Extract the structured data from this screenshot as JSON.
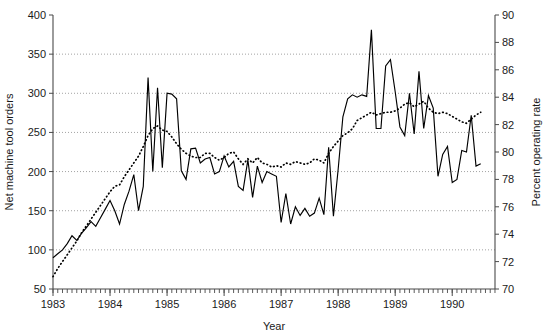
{
  "chart_data": {
    "type": "line",
    "title": "",
    "xlabel": "Year",
    "ylabel": "Net machine tool orders",
    "ylabel_right": "Percent operating rate",
    "grid": true,
    "legend": "none",
    "xlim": [
      1983.0,
      1990.75
    ],
    "ylim": [
      50,
      400
    ],
    "ylim_right": [
      70,
      90
    ],
    "ytick_labels": [
      "50",
      "100",
      "150",
      "200",
      "250",
      "300",
      "350",
      "400"
    ],
    "ytick_values": [
      50,
      100,
      150,
      200,
      250,
      300,
      350,
      400
    ],
    "ytick_right_labels": [
      "70",
      "72",
      "74",
      "76",
      "78",
      "80",
      "82",
      "84",
      "86",
      "88",
      "90"
    ],
    "ytick_right_values": [
      70,
      72,
      74,
      76,
      78,
      80,
      82,
      84,
      86,
      88,
      90
    ],
    "xtick_labels": [
      "1983",
      "1984",
      "1985",
      "1986",
      "1987",
      "1988",
      "1989",
      "1990"
    ],
    "xtick_values": [
      1983,
      1984,
      1985,
      1986,
      1987,
      1988,
      1989,
      1990
    ],
    "x_minor_tick_interval": 0.08333,
    "series": [
      {
        "name": "Net machine tool orders",
        "axis": "left",
        "style": "solid",
        "x": [
          1983.0,
          1983.083,
          1983.167,
          1983.25,
          1983.333,
          1983.417,
          1983.5,
          1983.583,
          1983.667,
          1983.75,
          1983.833,
          1983.917,
          1984.0,
          1984.083,
          1984.167,
          1984.25,
          1984.333,
          1984.417,
          1984.5,
          1984.583,
          1984.667,
          1984.75,
          1984.833,
          1984.917,
          1985.0,
          1985.083,
          1985.167,
          1985.25,
          1985.333,
          1985.417,
          1985.5,
          1985.583,
          1985.667,
          1985.75,
          1985.833,
          1985.917,
          1986.0,
          1986.083,
          1986.167,
          1986.25,
          1986.333,
          1986.417,
          1986.5,
          1986.583,
          1986.667,
          1986.75,
          1986.833,
          1986.917,
          1987.0,
          1987.083,
          1987.167,
          1987.25,
          1987.333,
          1987.417,
          1987.5,
          1987.583,
          1987.667,
          1987.75,
          1987.833,
          1987.917,
          1988.0,
          1988.083,
          1988.167,
          1988.25,
          1988.333,
          1988.417,
          1988.5,
          1988.583,
          1988.667,
          1988.75,
          1988.833,
          1988.917,
          1989.0,
          1989.083,
          1989.167,
          1989.25,
          1989.333,
          1989.417,
          1989.5,
          1989.583,
          1989.667,
          1989.75,
          1989.833,
          1989.917,
          1990.0,
          1990.083,
          1990.167,
          1990.25,
          1990.333,
          1990.417,
          1990.5
        ],
        "y": [
          90,
          95,
          100,
          108,
          118,
          112,
          121,
          128,
          136,
          130,
          141,
          152,
          163,
          150,
          133,
          158,
          175,
          196,
          150,
          181,
          320,
          200,
          307,
          205,
          300,
          299,
          293,
          201,
          190,
          229,
          230,
          211,
          216,
          218,
          197,
          200,
          220,
          206,
          213,
          181,
          176,
          215,
          167,
          207,
          186,
          200,
          197,
          194,
          135,
          172,
          133,
          155,
          144,
          153,
          143,
          147,
          166,
          145,
          231,
          143,
          203,
          270,
          293,
          298,
          295,
          298,
          296,
          381,
          255,
          255,
          335,
          343,
          302,
          257,
          246,
          300,
          248,
          328,
          255,
          297,
          281,
          194,
          222,
          232,
          186,
          190,
          227,
          225,
          272,
          207,
          210
        ]
      },
      {
        "name": "Percent operating rate",
        "axis": "right",
        "style": "dotted",
        "x": [
          1983.0,
          1983.083,
          1983.167,
          1983.25,
          1983.333,
          1983.417,
          1983.5,
          1983.583,
          1983.667,
          1983.75,
          1983.833,
          1983.917,
          1984.0,
          1984.083,
          1984.167,
          1984.25,
          1984.333,
          1984.417,
          1984.5,
          1984.583,
          1984.667,
          1984.75,
          1984.833,
          1984.917,
          1985.0,
          1985.083,
          1985.167,
          1985.25,
          1985.333,
          1985.417,
          1985.5,
          1985.583,
          1985.667,
          1985.75,
          1985.833,
          1985.917,
          1986.0,
          1986.083,
          1986.167,
          1986.25,
          1986.333,
          1986.417,
          1986.5,
          1986.583,
          1986.667,
          1986.75,
          1986.833,
          1986.917,
          1987.0,
          1987.083,
          1987.167,
          1987.25,
          1987.333,
          1987.417,
          1987.5,
          1987.583,
          1987.667,
          1987.75,
          1987.833,
          1987.917,
          1988.0,
          1988.083,
          1988.167,
          1988.25,
          1988.333,
          1988.417,
          1988.5,
          1988.583,
          1988.667,
          1988.75,
          1988.833,
          1988.917,
          1989.0,
          1989.083,
          1989.167,
          1989.25,
          1989.333,
          1989.417,
          1989.5,
          1989.583,
          1989.667,
          1989.75,
          1989.833,
          1989.917,
          1990.0,
          1990.083,
          1990.167,
          1990.25,
          1990.333,
          1990.417,
          1990.5
        ],
        "y": [
          70.9,
          71.5,
          72.0,
          72.5,
          73.0,
          73.5,
          74.1,
          74.6,
          75.1,
          75.6,
          76.1,
          76.6,
          77.1,
          77.5,
          77.6,
          78.2,
          78.7,
          79.2,
          79.7,
          80.4,
          81.2,
          81.7,
          81.9,
          81.6,
          81.5,
          81.1,
          80.6,
          80.2,
          79.9,
          79.7,
          79.6,
          79.6,
          79.9,
          79.9,
          79.6,
          79.4,
          79.6,
          79.9,
          80.0,
          79.5,
          79.1,
          79.5,
          79.2,
          79.6,
          79.2,
          79.1,
          78.9,
          79.0,
          78.9,
          79.2,
          79.1,
          79.3,
          79.2,
          79.1,
          79.2,
          79.5,
          79.4,
          79.2,
          79.9,
          80.4,
          80.8,
          81.2,
          81.4,
          81.7,
          82.3,
          82.5,
          82.7,
          82.9,
          82.7,
          82.8,
          82.9,
          82.9,
          83.0,
          83.2,
          83.5,
          83.6,
          83.3,
          83.5,
          83.7,
          83.2,
          82.9,
          82.8,
          82.9,
          82.8,
          82.6,
          82.4,
          82.2,
          82.1,
          82.4,
          82.7,
          82.9
        ]
      }
    ]
  },
  "axes": {
    "left_title": "Net machine tool orders",
    "right_title": "Percent operating rate",
    "bottom_title": "Year"
  }
}
